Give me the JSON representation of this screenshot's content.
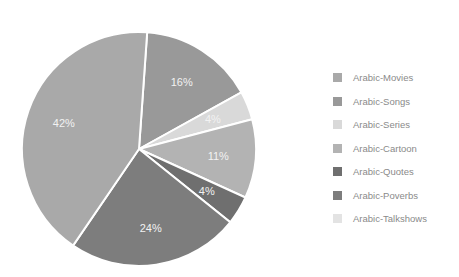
{
  "chart_data": {
    "type": "pie",
    "title": "",
    "legend_position": "right",
    "categories": [
      "Arabic-Movies",
      "Arabic-Songs",
      "Arabic-Series",
      "Arabic-Cartoon",
      "Arabic-Quotes",
      "Arabic-Poverbs",
      "Arabic-Talkshows"
    ],
    "values": [
      42,
      16,
      4,
      11,
      4,
      24,
      0
    ],
    "labels": [
      "42%",
      "16%",
      "4%",
      "11%",
      "4%",
      "24%",
      ""
    ],
    "colors": [
      "#a9a9a9",
      "#999999",
      "#d9d9d9",
      "#b3b3b3",
      "#6f6f6f",
      "#7d7d7d",
      "#e3e3e3"
    ]
  },
  "legend": {
    "items": [
      {
        "label": "Arabic-Movies",
        "color": "#a9a9a9"
      },
      {
        "label": "Arabic-Songs",
        "color": "#999999"
      },
      {
        "label": "Arabic-Series",
        "color": "#d9d9d9"
      },
      {
        "label": "Arabic-Cartoon",
        "color": "#b3b3b3"
      },
      {
        "label": "Arabic-Quotes",
        "color": "#6f6f6f"
      },
      {
        "label": "Arabic-Poverbs",
        "color": "#7d7d7d"
      },
      {
        "label": "Arabic-Talkshows",
        "color": "#e3e3e3"
      }
    ]
  }
}
